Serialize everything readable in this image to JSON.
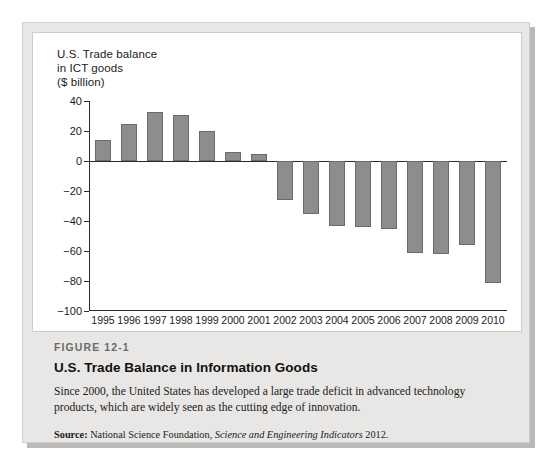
{
  "figure": {
    "number_label": "FIGURE 12-1",
    "title": "U.S. Trade Balance in Information Goods",
    "description": "Since 2000, the United States has developed a large trade deficit in advanced technology products, which are widely seen as the cutting edge of innovation.",
    "source_prefix": "Source:",
    "source_org": " National Science Foundation, ",
    "source_publication": "Science and Engineering Indicators",
    "source_year": " 2012."
  },
  "colors": {
    "bar_fill": "#8d8d8d",
    "bar_stroke": "#6a6a6a",
    "axis": "#2b2b2b",
    "panel_background": "#ffffff",
    "caption_background": "#e8e7e5"
  },
  "chart_data": {
    "type": "bar",
    "title": "U.S. Trade balance\nin ICT goods\n($ billion)",
    "xlabel": "",
    "ylabel": "$ billion",
    "ylim": [
      -100,
      40
    ],
    "ytick_step": 20,
    "yticks": [
      40,
      20,
      0,
      -20,
      -40,
      -60,
      -80,
      -100
    ],
    "ytick_labels": [
      "40",
      "20",
      "0",
      "−20",
      "−40",
      "−60",
      "−80",
      "−100"
    ],
    "grid": false,
    "legend": "none",
    "categories": [
      "1995",
      "1996",
      "1997",
      "1998",
      "1999",
      "2000",
      "2001",
      "2002",
      "2003",
      "2004",
      "2005",
      "2006",
      "2007",
      "2008",
      "2009",
      "2010"
    ],
    "values": [
      14,
      25,
      33,
      31,
      20,
      6,
      5,
      -26,
      -35,
      -43,
      -44,
      -45,
      -61,
      -62,
      -56,
      -81
    ]
  }
}
